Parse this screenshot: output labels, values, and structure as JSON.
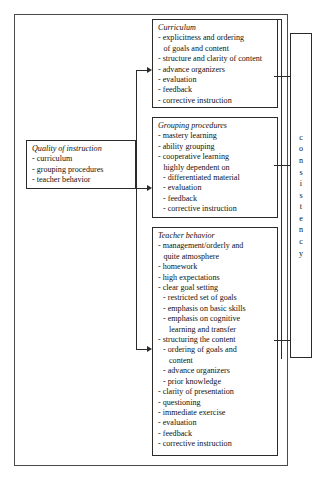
{
  "diagram": {
    "outer_frame": "outer-border",
    "boxes": {
      "quality": {
        "title": "Quality of instruction",
        "items": [
          "- curriculum",
          "- grouping procedures",
          "- teacher behavior"
        ]
      },
      "curriculum": {
        "title": "Curriculum",
        "items": [
          "- explicitness and ordering",
          "of goals and content",
          "- structure and clarity of content",
          "- advance organizers",
          "- evaluation",
          "- feedback",
          "- corrective instruction"
        ]
      },
      "grouping": {
        "title": "Grouping procedures",
        "items": [
          "- mastery learning",
          "- ability grouping",
          "- cooperative learning",
          "highly dependent on",
          "- differentiated material",
          "- evaluation",
          "- feedback",
          "- corrective instruction"
        ]
      },
      "teacher": {
        "title": "Teacher behavior",
        "items": [
          "- management/orderly and",
          "quite atmosphere",
          "- homework",
          "- high expectations",
          "- clear goal setting",
          "- restricted set of goals",
          "- emphasis on basic skills",
          "- emphasis on cognitive",
          "learning and transfer",
          "- structuring the content",
          "- ordering of goals and",
          "content",
          "- advance organizers",
          "- prior knowledge",
          "- clarity of presentation",
          "- questioning",
          "- immediate exercise",
          "- evaluation",
          "- feedback",
          "- corrective instruction"
        ]
      },
      "consistency": {
        "label": "consistency",
        "letters": [
          "c",
          "o",
          "n",
          "s",
          "i",
          "s",
          "t",
          "e",
          "n",
          "c",
          "y"
        ]
      }
    },
    "connectors": {
      "arrow_to_curriculum": "arrow-right",
      "arrow_to_grouping": "arrow-right",
      "arrow_to_teacher": "arrow-right",
      "consistency_bracket": "bracket-line"
    },
    "colors": {
      "stroke": "#2b2b2b",
      "frame": "#4a4a4a",
      "background": "#ffffff",
      "text": "#111111"
    }
  }
}
